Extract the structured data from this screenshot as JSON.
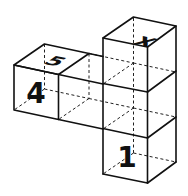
{
  "figure": {
    "type": "cube-net-isometric",
    "labels": {
      "top_right_cube": "X",
      "top_left_cube": "5",
      "front_left_cube": "4",
      "bottom_cube_front": "1"
    },
    "colors": {
      "line": "#111111",
      "background": "#ffffff"
    }
  }
}
